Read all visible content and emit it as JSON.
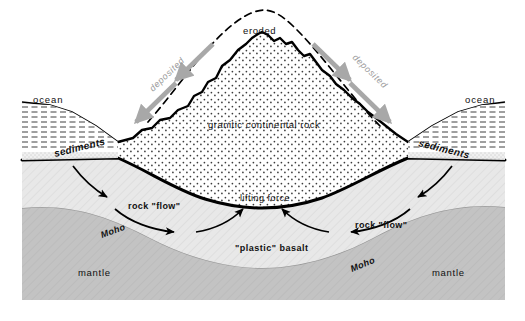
{
  "figure": {
    "background_color": "#ffffff"
  },
  "labels": {
    "ocean_left": "ocean",
    "ocean_right": "ocean",
    "sediments_left": "sediments",
    "sediments_right": "sediments",
    "eroded": "eroded",
    "deposited_left": "deposited",
    "deposited_right": "deposited",
    "granitic_rock": "granitic continental rock",
    "lifting_force": "lifting force",
    "plastic_basalt": "\"plastic\" basalt",
    "rock_flow_left": "rock \"flow\"",
    "rock_flow_right": "rock \"flow\"",
    "moho_left": "Moho",
    "moho_right": "Moho",
    "mantle_left": "mantle",
    "mantle_right": "mantle"
  },
  "layers": [
    {
      "name": "ocean-water",
      "label": "ocean",
      "fill": "#ffffff",
      "pattern": "horizontal-dashes"
    },
    {
      "name": "sediment-wedge",
      "label": "sediments",
      "fill": "#ececec",
      "pattern": "fine-stipple"
    },
    {
      "name": "continental-crust",
      "label": "granitic continental rock",
      "fill": "#ffffff",
      "pattern": "coarse-stipple"
    },
    {
      "name": "basalt-layer",
      "label": "\"plastic\" basalt",
      "fill": "#e6e6e6",
      "pattern": "diagonal-hatch"
    },
    {
      "name": "mantle-layer",
      "label": "mantle",
      "fill": "#c2c2c2",
      "pattern": "diagonal-hatch"
    }
  ],
  "colors": {
    "outline": "#000000",
    "mantle": "#c2c2c2",
    "basalt": "#e6e6e6",
    "sediment": "#ececec",
    "deposited_arrow": "#a8a8a8",
    "moho_line": "#9b9b9b",
    "water_line": "#2b2b2b"
  },
  "annotations": [
    {
      "name": "eroded-profile",
      "style": "dashed",
      "meaning": "original mountain profile before erosion"
    },
    {
      "name": "deposited-arrow-left",
      "direction": "down-left",
      "color": "#a8a8a8"
    },
    {
      "name": "deposited-arrow-right",
      "direction": "down-right",
      "color": "#a8a8a8"
    },
    {
      "name": "flow-arrow-left",
      "direction": "down-right",
      "color": "#000000"
    },
    {
      "name": "flow-arrow-right",
      "direction": "down-left",
      "color": "#000000"
    },
    {
      "name": "lifting-arrow-left",
      "direction": "up-right",
      "color": "#000000"
    },
    {
      "name": "lifting-arrow-right",
      "direction": "up-left",
      "color": "#000000"
    }
  ]
}
